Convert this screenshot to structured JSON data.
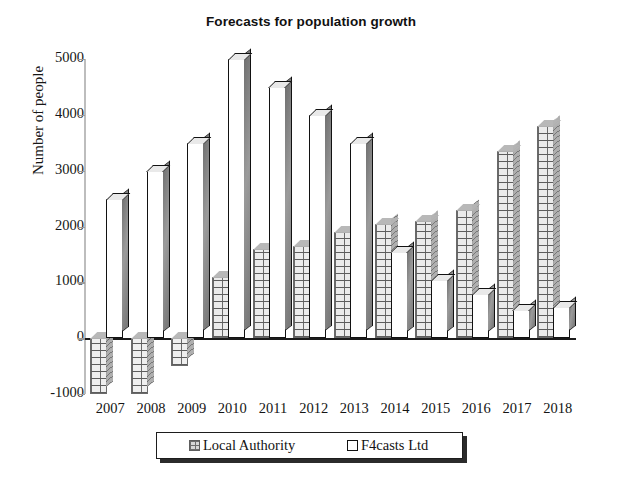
{
  "chart_data": {
    "type": "bar",
    "title": "Forecasts for population growth",
    "xlabel": "",
    "ylabel": "Number of people",
    "categories": [
      "2007",
      "2008",
      "2009",
      "2010",
      "2011",
      "2012",
      "2013",
      "2014",
      "2015",
      "2016",
      "2017",
      "2018"
    ],
    "yticks": [
      5000,
      4000,
      3000,
      2000,
      1000,
      0,
      -1000
    ],
    "ylim": [
      -1000,
      5000
    ],
    "grid": false,
    "legend_position": "bottom-center",
    "series": [
      {
        "name": "Local Authority",
        "color": "#d9d9d9",
        "pattern": "brick",
        "values": [
          -1000,
          -1000,
          -500,
          1100,
          1600,
          1650,
          1900,
          2050,
          2100,
          2300,
          3350,
          3800
        ]
      },
      {
        "name": "F4casts Ltd",
        "color": "#ffffff",
        "pattern": "solid",
        "values": [
          2500,
          3000,
          3500,
          5000,
          4500,
          4000,
          3500,
          1550,
          1050,
          800,
          500,
          550
        ]
      }
    ]
  },
  "legend": {
    "items": [
      {
        "label": "Local Authority",
        "swatch": "grey-brick-swatch"
      },
      {
        "label": "F4casts Ltd",
        "swatch": "white-swatch"
      }
    ]
  }
}
